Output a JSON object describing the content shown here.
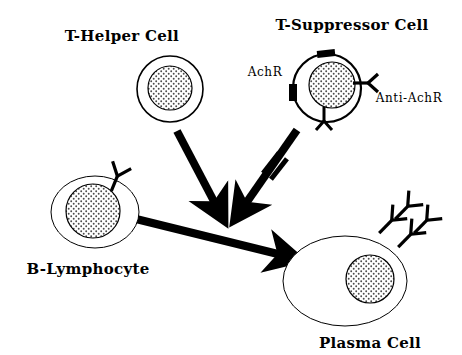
{
  "figure": {
    "background_color": "#ffffff",
    "ink_color": "#000000",
    "width": 462,
    "height": 355
  },
  "labels": {
    "t_helper": "T-Helper Cell",
    "t_suppressor": "T-Suppressor Cell",
    "b_lymphocyte": "B-Lymphocyte",
    "plasma_cell": "Plasma Cell",
    "achr": "AchR",
    "anti_achr": "Anti-AchR"
  },
  "cells": [
    {
      "id": "t-helper-cell",
      "label": "T-Helper Cell",
      "shape": "circle",
      "cx": 170,
      "cy": 89,
      "rx": 33,
      "ry": 33,
      "nucleus_cx": 170,
      "nucleus_cy": 88,
      "nucleus_r": 22,
      "nucleus_fill": "stipple",
      "label_x": 122,
      "label_y": 41,
      "label_anchor": "middle"
    },
    {
      "id": "t-suppressor-cell",
      "label": "T-Suppressor Cell",
      "shape": "circle",
      "cx": 327,
      "cy": 88,
      "rx": 34,
      "ry": 34,
      "nucleus_cx": 332,
      "nucleus_cy": 85,
      "nucleus_r": 23,
      "nucleus_fill": "stipple",
      "label_x": 352,
      "label_y": 30,
      "label_anchor": "middle"
    },
    {
      "id": "b-lymphocyte",
      "label": "B-Lymphocyte",
      "shape": "ellipse",
      "cx": 95,
      "cy": 212,
      "rx": 44,
      "ry": 36,
      "nucleus_cx": 93,
      "nucleus_cy": 211,
      "nucleus_r": 27,
      "nucleus_fill": "stipple",
      "label_x": 88,
      "label_y": 274,
      "label_anchor": "middle"
    },
    {
      "id": "plasma-cell",
      "label": "Plasma Cell",
      "shape": "ellipse",
      "cx": 345,
      "cy": 281,
      "rx": 62,
      "ry": 45,
      "nucleus_cx": 370,
      "nucleus_cy": 279,
      "nucleus_r": 24,
      "nucleus_fill": "stipple",
      "label_x": 370,
      "label_y": 348,
      "label_anchor": "middle"
    }
  ],
  "receptors": [
    {
      "id": "achr-receptor-top",
      "host": "t-suppressor-cell",
      "x": 318,
      "y": 50,
      "w": 17,
      "h": 7,
      "rotate": -6
    },
    {
      "id": "achr-receptor-left",
      "host": "t-suppressor-cell",
      "x": 289,
      "y": 85,
      "w": 8,
      "h": 16,
      "rotate": 0
    }
  ],
  "antibodies": [
    {
      "id": "anti-achr-right",
      "host": "t-suppressor-cell",
      "cx": 366,
      "cy": 82,
      "angle": 90,
      "scale": 1.0
    },
    {
      "id": "anti-achr-bottom",
      "host": "t-suppressor-cell",
      "cx": 325,
      "cy": 121,
      "angle": 180,
      "scale": 1.0
    },
    {
      "id": "surface-antibody-b-cell",
      "host": "b-lymphocyte",
      "cx": 119,
      "cy": 172,
      "angle": 20,
      "scale": 1.0
    },
    {
      "id": "secreted-antibody-1",
      "host": "plasma-cell",
      "cx": 392,
      "cy": 216,
      "angle": 48,
      "scale": 1.05
    },
    {
      "id": "secreted-antibody-2",
      "host": "plasma-cell",
      "cx": 404,
      "cy": 206,
      "angle": 48,
      "scale": 1.05
    },
    {
      "id": "secreted-antibody-3",
      "host": "plasma-cell",
      "cx": 412,
      "cy": 228,
      "angle": 48,
      "scale": 1.05
    },
    {
      "id": "secreted-antibody-4",
      "host": "plasma-cell",
      "cx": 424,
      "cy": 218,
      "angle": 48,
      "scale": 1.05
    }
  ],
  "arrows": [
    {
      "id": "arrow-t-helper-to-differentiation",
      "from": "t-helper-cell",
      "to": "differentiation-point",
      "type": "stimulatory",
      "x1": 177,
      "y1": 131,
      "x2": 222,
      "y2": 216
    },
    {
      "id": "arrow-t-suppressor-to-differentiation",
      "from": "t-suppressor-cell",
      "to": "differentiation-point",
      "type": "stimulatory",
      "x1": 297,
      "y1": 130,
      "x2": 237,
      "y2": 216
    },
    {
      "id": "arrow-b-lymphocyte-to-plasma-cell",
      "from": "b-lymphocyte",
      "to": "plasma-cell",
      "type": "differentiation",
      "x1": 132,
      "y1": 218,
      "x2": 293,
      "y2": 258
    }
  ],
  "inhibition_marks": [
    {
      "id": "suppression-block-mark",
      "on_arrow": "arrow-t-suppressor-to-differentiation",
      "cx": 275,
      "cy": 166,
      "angle": -55
    }
  ]
}
